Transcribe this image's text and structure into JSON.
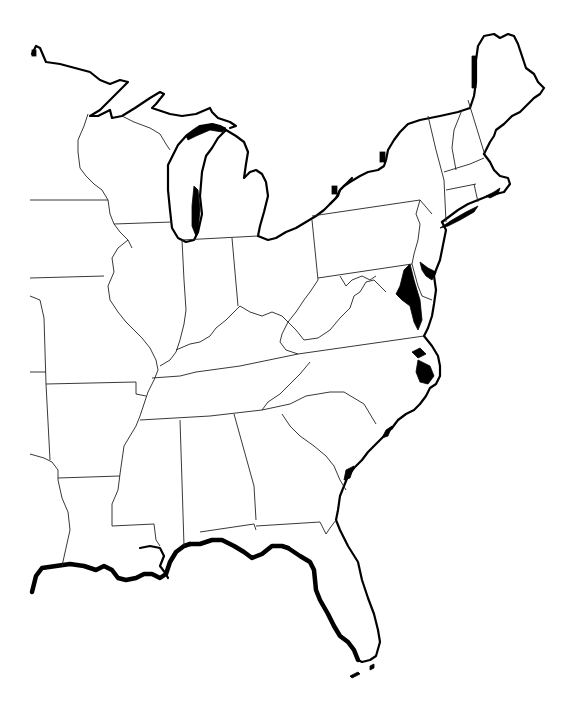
{
  "map": {
    "title": "",
    "type": "blank outline map",
    "region": "Eastern United States",
    "background_color": "#ffffff",
    "line_color": "#000000",
    "labels": [],
    "states_depicted": [
      "Minnesota (partial)",
      "Wisconsin",
      "Michigan",
      "Iowa (partial)",
      "Illinois",
      "Indiana",
      "Ohio",
      "Missouri",
      "Kentucky",
      "West Virginia",
      "Pennsylvania",
      "New York",
      "Vermont",
      "New Hampshire",
      "Maine",
      "Massachusetts",
      "Connecticut",
      "Rhode Island",
      "New Jersey",
      "Delaware",
      "Maryland",
      "Virginia",
      "North Carolina",
      "Tennessee",
      "Arkansas",
      "South Carolina",
      "Georgia",
      "Alabama",
      "Mississippi",
      "Louisiana",
      "Florida",
      "Oklahoma (partial)",
      "Texas (partial)",
      "Kansas (partial)"
    ]
  }
}
